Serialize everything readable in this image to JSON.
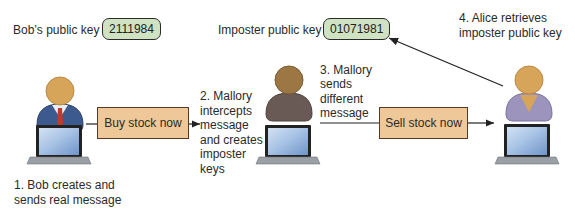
{
  "bob": {
    "key_label": "Bob’s public key",
    "key_value": "2111984",
    "caption_line1": "1. Bob creates and",
    "caption_line2": "sends real message"
  },
  "mallory": {
    "key_label": "Imposter public key",
    "key_value": "01071981",
    "step2_lines": [
      "2. Mallory",
      "intercepts",
      "message",
      "and creates",
      "imposter",
      "keys"
    ],
    "step3_lines": [
      "3. Mallory",
      "sends",
      "different",
      "message"
    ]
  },
  "alice": {
    "step4_line1": "4. Alice retrieves",
    "step4_line2": "imposter public key"
  },
  "messages": {
    "real": "Buy stock now",
    "fake": "Sell stock now"
  },
  "colors": {
    "key_fill": "#cfe3c2",
    "message_fill": "#eec898",
    "head": "#d6a55a",
    "bob_body": "#3d5a8f",
    "mallory_body": "#6a5a55",
    "alice_body": "#9c94bd",
    "screen": "#86a9d6"
  }
}
